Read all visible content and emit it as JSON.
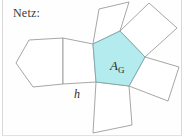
{
  "figure": {
    "caption": "Netz:",
    "base_area_label": "A",
    "base_area_subscript": "G",
    "height_label": "h",
    "colors": {
      "base_fill": "#b3ebee",
      "stroke": "#8c8c8c",
      "base_stroke": "#6f9fa6",
      "background": "#fefefe",
      "frame": "#d8d8d8",
      "text": "#2b2b2b"
    },
    "geometry": {
      "type": "pentagonal-prism-net",
      "base_polygon_sides": 5,
      "lateral_faces": 5,
      "base_faces": 2,
      "highlighted_face": "base-pentagon-right",
      "base_pentagon_points": "93,44 120,31 145,57 129,86 96,82",
      "left_pentagon_points": "29,40 63,38 63,84 33,87 16,63",
      "center_square_points": "63,38 93,44 96,82 63,84",
      "top_square_points": "93,44 99,9 129,2 120,31",
      "upper_right_square_points": "120,31 149,3 177,28 145,57",
      "lower_right_square_points": "145,57 179,67 168,101 129,86",
      "bottom_square_points": "129,86 132,125 93,133 96,82"
    }
  }
}
